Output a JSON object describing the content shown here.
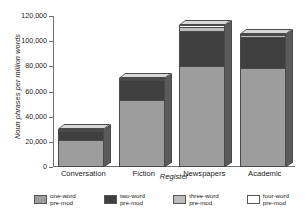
{
  "chart_data": {
    "type": "bar",
    "subtype": "stacked-bar-3d",
    "title": "",
    "xlabel": "Register",
    "ylabel": "Noun phrases per million words",
    "categories": [
      "Conversation",
      "Fiction",
      "Newspapers",
      "Academic"
    ],
    "ylim": [
      0,
      120000
    ],
    "ytick_values": [
      0,
      20000,
      40000,
      60000,
      80000,
      100000,
      120000
    ],
    "ytick_labels": [
      "0",
      "20,000",
      "40,000",
      "60,000",
      "80,000",
      "100,000",
      "120,000"
    ],
    "grid": false,
    "legend_position": "bottom",
    "series": [
      {
        "name": "one-word pre-mod",
        "color": "#9d9d9d",
        "values": [
          22000,
          53000,
          80000,
          79000
        ]
      },
      {
        "name": "two-word pre-mod",
        "color": "#3f3f3f",
        "values": [
          7000,
          16000,
          28000,
          24000
        ]
      },
      {
        "name": "three-word pre-mod",
        "color": "#bcbcbc",
        "values": [
          800,
          1200,
          3000,
          2000
        ]
      },
      {
        "name": "four-word pre-mod",
        "color": "#ffffff",
        "values": [
          400,
          800,
          2000,
          1000
        ]
      }
    ],
    "totals": [
      30200,
      71000,
      113000,
      106000
    ]
  },
  "legend": {
    "items": [
      {
        "line1": "one-word",
        "line2": "pre-mod",
        "swatch": "one"
      },
      {
        "line1": "two-word",
        "line2": "pre-mod",
        "swatch": "two"
      },
      {
        "line1": "three-word",
        "line2": "pre-mod",
        "swatch": "three"
      },
      {
        "line1": "four-word",
        "line2": "pre-mod",
        "swatch": "four"
      }
    ]
  }
}
